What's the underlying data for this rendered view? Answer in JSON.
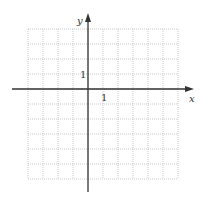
{
  "diagram": {
    "type": "coordinate-grid",
    "x_axis_label": "x",
    "y_axis_label": "y",
    "x_unit_label": "1",
    "y_unit_label": "1",
    "grid": {
      "columns": 10,
      "rows": 10,
      "cell_px": 15,
      "origin_col": 4,
      "origin_row": 4,
      "line_style": "dotted",
      "line_color": "#bbbbbb"
    },
    "axis_color": "#333333"
  }
}
